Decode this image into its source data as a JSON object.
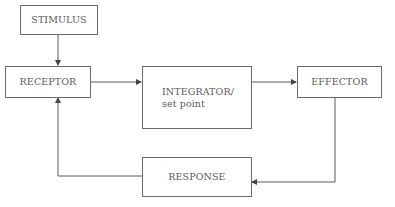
{
  "diagram": {
    "type": "feedback-loop-flowchart",
    "nodes": [
      {
        "id": "stimulus",
        "label": "STIMULUS"
      },
      {
        "id": "receptor",
        "label": "RECEPTOR"
      },
      {
        "id": "integrator",
        "label": "INTEGRATOR/\nset point"
      },
      {
        "id": "effector",
        "label": "EFFECTOR"
      },
      {
        "id": "response",
        "label": "RESPONSE"
      }
    ],
    "edges": [
      {
        "from": "stimulus",
        "to": "receptor"
      },
      {
        "from": "receptor",
        "to": "integrator"
      },
      {
        "from": "integrator",
        "to": "effector"
      },
      {
        "from": "effector",
        "to": "response"
      },
      {
        "from": "response",
        "to": "receptor"
      }
    ],
    "colors": {
      "line": "#5a5a5a",
      "text": "#5a5a5a",
      "background": "#ffffff"
    }
  }
}
